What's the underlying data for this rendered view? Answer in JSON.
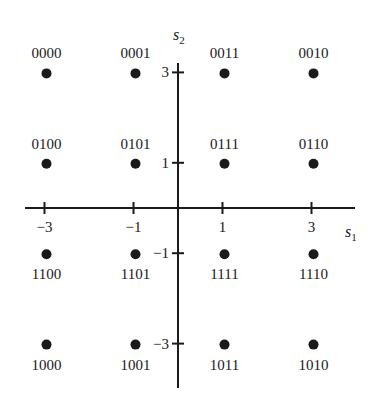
{
  "diagram": {
    "x_axis": {
      "name": "s",
      "subscript": "1",
      "ticks": [
        -3,
        -1,
        1,
        3
      ],
      "tick_labels": [
        "−3",
        "−1",
        "1",
        "3"
      ]
    },
    "y_axis": {
      "name": "s",
      "subscript": "2",
      "ticks": [
        3,
        1,
        -1,
        -3
      ],
      "tick_labels": [
        "3",
        "1",
        "−1",
        "−3"
      ]
    },
    "points": [
      {
        "s1": -3,
        "s2": 3,
        "label": "0000"
      },
      {
        "s1": -1,
        "s2": 3,
        "label": "0001"
      },
      {
        "s1": 1,
        "s2": 3,
        "label": "0011"
      },
      {
        "s1": 3,
        "s2": 3,
        "label": "0010"
      },
      {
        "s1": -3,
        "s2": 1,
        "label": "0100"
      },
      {
        "s1": -1,
        "s2": 1,
        "label": "0101"
      },
      {
        "s1": 1,
        "s2": 1,
        "label": "0111"
      },
      {
        "s1": 3,
        "s2": 1,
        "label": "0110"
      },
      {
        "s1": -3,
        "s2": -1,
        "label": "1100"
      },
      {
        "s1": -1,
        "s2": -1,
        "label": "1101"
      },
      {
        "s1": 1,
        "s2": -1,
        "label": "1111"
      },
      {
        "s1": 3,
        "s2": -1,
        "label": "1110"
      },
      {
        "s1": -3,
        "s2": -3,
        "label": "1000"
      },
      {
        "s1": -1,
        "s2": -3,
        "label": "1001"
      },
      {
        "s1": 1,
        "s2": -3,
        "label": "1011"
      },
      {
        "s1": 3,
        "s2": -3,
        "label": "1010"
      }
    ]
  }
}
